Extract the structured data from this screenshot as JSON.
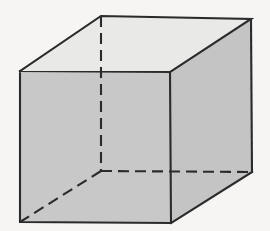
{
  "figure": {
    "caption": "",
    "background_color": "#f6f5f3",
    "colors": {
      "front_face": "#c8c8c8",
      "right_face": "#c4c4c4",
      "top_face": "#e9e9e7",
      "edge_stroke": "#2b2b2b"
    },
    "stroke": {
      "width": 2.1,
      "hidden_dash_pattern": "11 6"
    },
    "vertices": {
      "front_top_left": [
        20,
        71
      ],
      "front_top_right": [
        170,
        72
      ],
      "front_bottom_right": [
        171,
        223
      ],
      "front_bottom_left": [
        20,
        222
      ],
      "back_top_left": [
        101,
        16
      ],
      "back_top_right": [
        251,
        19
      ],
      "back_bottom_right": [
        252,
        172
      ],
      "back_bottom_left": [
        101,
        171
      ]
    },
    "faces": {
      "front": "20,71 170,72 171,223 20,222",
      "top": "20,71 101,16 251,19 170,72",
      "right": "170,72 251,19 252,172 171,223"
    },
    "edges": {
      "front_outline": "20,71 170,72 171,223 20,222 20,71",
      "top_outline": "20,71 101,16 251,19 170,72",
      "right_vertical_back": "251,19 252,172",
      "right_bottom": "252,172 171,223",
      "hidden_vertical": "101,16 101,171",
      "hidden_horizontal": "101,171 252,172",
      "hidden_diagonal": "101,171 20,222"
    }
  }
}
